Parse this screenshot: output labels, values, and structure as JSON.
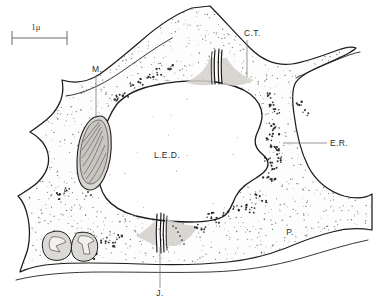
{
  "figure": {
    "kind": "electron-micrograph-line-drawing",
    "background_color": "#ffffff",
    "ink_color": "#1c1c1c",
    "stipple_color": "#7a7a7a",
    "organelle_fill": "#d8d6d2"
  },
  "scale_bar": {
    "label": "1μ",
    "x_start": 12,
    "x_end": 67,
    "y": 38,
    "tick_height": 7,
    "label_x": 36,
    "label_y": 30
  },
  "labels": [
    {
      "id": "ct",
      "text": "C.T.",
      "x": 244,
      "y": 36,
      "anchor": "start",
      "leader": {
        "x1": 247,
        "y1": 40,
        "x2": 247,
        "y2": 77
      }
    },
    {
      "id": "m",
      "text": "M.",
      "x": 92,
      "y": 72,
      "anchor": "start",
      "leader": {
        "x1": 96,
        "y1": 76,
        "x2": 96,
        "y2": 118
      }
    },
    {
      "id": "er",
      "text": "E.R.",
      "x": 330,
      "y": 146,
      "anchor": "start",
      "leader": {
        "x1": 283,
        "y1": 143,
        "x2": 327,
        "y2": 143
      }
    },
    {
      "id": "led",
      "text": "L.E.D.",
      "x": 167,
      "y": 158,
      "anchor": "middle",
      "leader": null
    },
    {
      "id": "p",
      "text": "P.",
      "x": 290,
      "y": 235,
      "anchor": "middle",
      "leader": null
    },
    {
      "id": "j",
      "text": "J.",
      "x": 160,
      "y": 296,
      "anchor": "middle",
      "leader": {
        "x1": 160,
        "y1": 247,
        "x2": 160,
        "y2": 288
      }
    }
  ],
  "legend_meaning": [
    {
      "abbr": "C.T.",
      "term": "cell-junction-top"
    },
    {
      "abbr": "M.",
      "term": "mitochondrion"
    },
    {
      "abbr": "E.R.",
      "term": "endoplasmic-reticulum"
    },
    {
      "abbr": "L.E.D.",
      "term": "lumen"
    },
    {
      "abbr": "P.",
      "term": "cytoplasm-process"
    },
    {
      "abbr": "J.",
      "term": "cell-junction-bottom"
    }
  ]
}
